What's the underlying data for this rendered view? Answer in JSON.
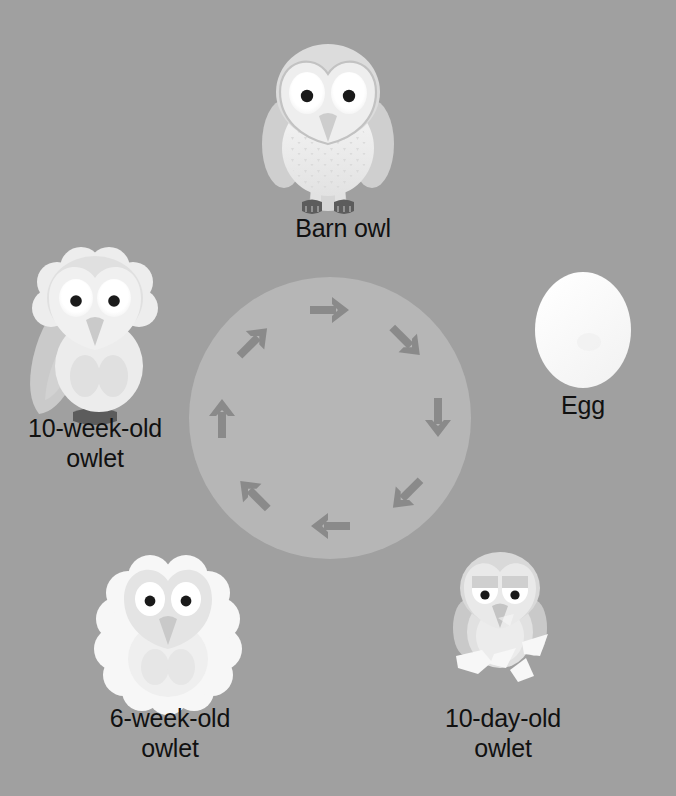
{
  "colors": {
    "background": "#a0a0a0",
    "cycle_circle": "#b6b6b6",
    "arrow": "#8a8a8a",
    "text": "#111111",
    "egg_white": "#fbfbfb",
    "owl_body_light": "#f2f2f2",
    "owl_body_shade": "#cfcfcf",
    "owl_face": "#e8e8e8",
    "eye_white": "#ffffff",
    "pupil": "#1a1a1a",
    "feet": "#5c5c5c",
    "beak": "#c9c9c9",
    "down_white": "#f7f7f7"
  },
  "stages": [
    {
      "id": "egg",
      "label": "Egg",
      "order": 1,
      "icon": "egg-icon",
      "position": {
        "x": 583,
        "y": 330
      }
    },
    {
      "id": "ten-day-old-owlet",
      "label": "10-day-old\nowlet",
      "order": 2,
      "icon": "hatchling-owlet-icon",
      "position": {
        "x": 500,
        "y": 620
      }
    },
    {
      "id": "six-week-old-owlet",
      "label": "6-week-old\nowlet",
      "order": 3,
      "icon": "downy-owlet-icon",
      "position": {
        "x": 168,
        "y": 625
      }
    },
    {
      "id": "ten-week-old-owlet",
      "label": "10-week-old\nowlet",
      "order": 4,
      "icon": "fledgling-owlet-icon",
      "position": {
        "x": 95,
        "y": 330
      }
    },
    {
      "id": "barn-owl",
      "label": "Barn owl",
      "order": 5,
      "icon": "adult-barn-owl-icon",
      "position": {
        "x": 328,
        "y": 120
      }
    }
  ],
  "cycle": {
    "direction": "clockwise",
    "arrow_count": 8,
    "center": {
      "x": 330,
      "y": 418
    },
    "radius": 141,
    "arrow_ring_radius": 108
  }
}
